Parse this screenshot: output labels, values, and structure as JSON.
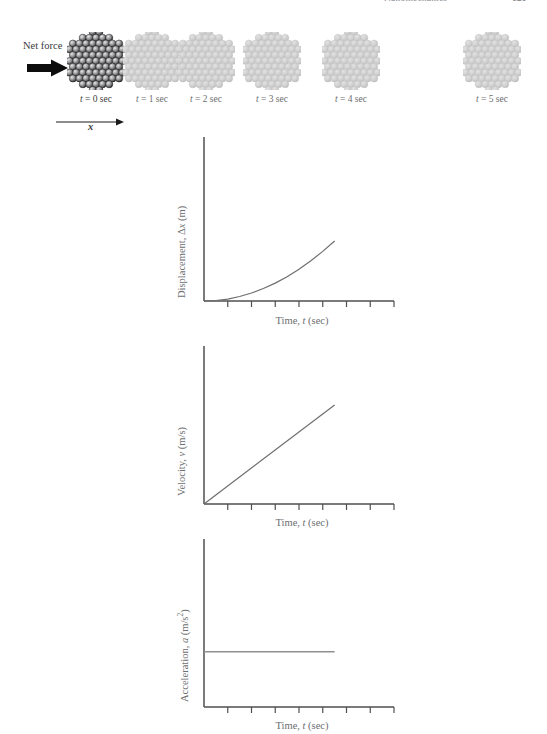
{
  "header": {
    "chapter_title": "Nanomechanics",
    "page_number": "121"
  },
  "figure": {
    "net_force_label": "Net force",
    "net_force_arrow_icon": "right-arrow-icon",
    "axis_direction_label": "x",
    "axis_direction_arrow_icon": "right-arrow-icon",
    "frames": [
      {
        "label": "t = 0 sec",
        "time": 0,
        "x_center": 96,
        "highlighted": true,
        "color": "#4a4a4c"
      },
      {
        "label": "t = 1 sec",
        "time": 1,
        "x_center": 152,
        "highlighted": false,
        "color": "#c9c9c9"
      },
      {
        "label": "t = 2 sec",
        "time": 2,
        "x_center": 206,
        "highlighted": false,
        "color": "#c9c9c9"
      },
      {
        "label": "t = 3 sec",
        "time": 3,
        "x_center": 272,
        "highlighted": false,
        "color": "#c9c9c9"
      },
      {
        "label": "t = 4 sec",
        "time": 4,
        "x_center": 351,
        "highlighted": false,
        "color": "#c9c9c9"
      },
      {
        "label": "t = 5 sec",
        "time": 5,
        "x_center": 492,
        "highlighted": false,
        "color": "#c9c9c9"
      }
    ]
  },
  "chart_data": [
    {
      "type": "line",
      "id": "displacement",
      "title": "",
      "ylabel": "Displacement, Δx (m)",
      "xlabel": "Time, t (sec)",
      "xlabel_parts": {
        "pre": "Time, ",
        "italic": "t",
        "post": " (sec)"
      },
      "relation": "quadratic",
      "grid": false,
      "legend": null,
      "xlim": [
        0,
        8
      ],
      "ylim": [
        0,
        10
      ],
      "x": [
        0,
        0.5,
        1,
        1.5,
        2,
        2.5,
        3,
        3.5,
        4,
        4.5,
        5,
        5.5
      ],
      "y": [
        0,
        0.033,
        0.13,
        0.3,
        0.53,
        0.83,
        1.19,
        1.62,
        2.12,
        2.68,
        3.31,
        4.0
      ],
      "x_ticks": [
        1,
        2,
        3,
        4,
        5,
        6,
        7,
        8
      ],
      "x_tick_labels": [
        "",
        "",
        "",
        "",
        "",
        "",
        "",
        ""
      ],
      "y_ticks": [],
      "y_tick_labels": []
    },
    {
      "type": "line",
      "id": "velocity",
      "title": "",
      "ylabel": "Velocity, v (m/s)",
      "ylabel_parts": {
        "pre": "Velocity, ",
        "italic": "v",
        "post": " (m/s)"
      },
      "xlabel": "Time, t (sec)",
      "xlabel_parts": {
        "pre": "Time, ",
        "italic": "t",
        "post": " (sec)"
      },
      "relation": "linear",
      "grid": false,
      "legend": null,
      "xlim": [
        0,
        8
      ],
      "ylim": [
        0,
        10
      ],
      "x": [
        0,
        5.5
      ],
      "y": [
        0,
        6.6
      ],
      "x_ticks": [
        1,
        2,
        3,
        4,
        5,
        6,
        7,
        8
      ],
      "x_tick_labels": [
        "",
        "",
        "",
        "",
        "",
        "",
        "",
        ""
      ],
      "y_ticks": [],
      "y_tick_labels": []
    },
    {
      "type": "line",
      "id": "acceleration",
      "title": "",
      "ylabel": "Acceleration, a (m/s²)",
      "ylabel_parts": {
        "pre": "Acceleration, ",
        "italic": "a",
        "post": " (m/s",
        "sup": "2",
        "post2": ")"
      },
      "xlabel": "Time, t (sec)",
      "xlabel_parts": {
        "pre": "Time, ",
        "italic": "t",
        "post": " (sec)"
      },
      "relation": "constant",
      "grid": false,
      "legend": null,
      "xlim": [
        0,
        8
      ],
      "ylim": [
        0,
        10
      ],
      "x": [
        0,
        5.5
      ],
      "y": [
        3.5,
        3.5
      ],
      "x_ticks": [
        1,
        2,
        3,
        4,
        5,
        6,
        7,
        8
      ],
      "x_tick_labels": [
        "",
        "",
        "",
        "",
        "",
        "",
        "",
        ""
      ],
      "y_ticks": [],
      "y_tick_labels": []
    }
  ],
  "labels": {
    "time_axis_pre": "Time, ",
    "time_axis_it": "t",
    "time_axis_post": " (sec)",
    "disp_y_pre": "Displacement, Δ",
    "disp_y_it": "x",
    "disp_y_post": " (m)",
    "vel_y_pre": "Velocity, ",
    "vel_y_it": "v",
    "vel_y_post": " (m/s)",
    "acc_y_pre": "Acceleration, ",
    "acc_y_it": "a",
    "acc_y_post": " (m/s",
    "acc_y_sup": "2",
    "acc_y_post2": ")"
  }
}
